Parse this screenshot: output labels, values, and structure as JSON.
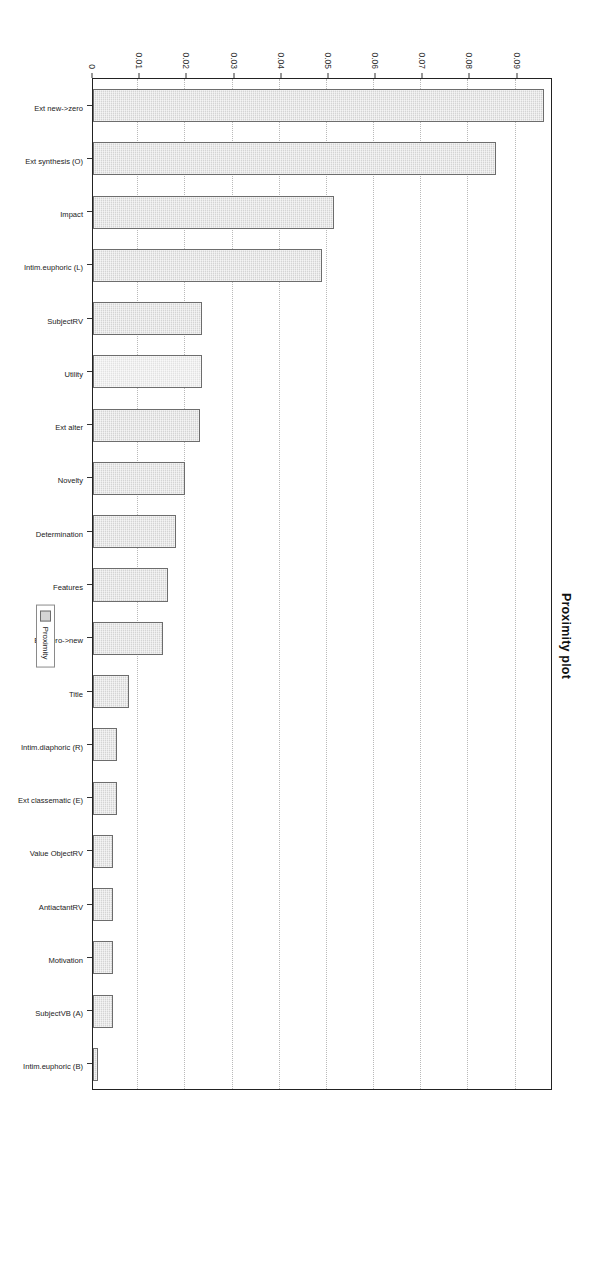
{
  "chart_data": {
    "type": "bar",
    "title": "Proximity plot",
    "xlabel": "",
    "ylabel": "",
    "orientation": "vertical-rotated-90",
    "grid": true,
    "legend_position": "bottom-center",
    "legend": [
      "Proximity"
    ],
    "ylim": [
      0,
      0.0975
    ],
    "yticks": [
      "0",
      "0.01",
      "0.02",
      "0.03",
      "0.04",
      "0.05",
      "0.06",
      "0.07",
      "0.08",
      "0.09"
    ],
    "ytick_values": [
      0,
      0.01,
      0.02,
      0.03,
      0.04,
      0.05,
      0.06,
      0.07,
      0.08,
      0.09
    ],
    "categories": [
      "Ext new->zero",
      "Ext synthesis (O)",
      "Impact",
      "Intim.euphoric (L)",
      "SubjectRV",
      "Utility",
      "Ext alter",
      "Novelty",
      "Determination",
      "Features",
      "Ext zero->new",
      "Title",
      "Intim.diaphoric (R)",
      "Ext classematic (E)",
      "Value ObjectRV",
      "AntiactantRV",
      "Motivation",
      "SubjectVB (A)",
      "Intim.euphoric (B)"
    ],
    "values": [
      0.0955,
      0.0855,
      0.051,
      0.0485,
      0.0232,
      0.0232,
      0.0227,
      0.0195,
      0.0175,
      0.0158,
      0.0148,
      0.0077,
      0.005,
      0.005,
      0.0043,
      0.0043,
      0.0043,
      0.0043,
      0.001
    ],
    "series": [
      {
        "name": "Proximity",
        "values": [
          0.0955,
          0.0855,
          0.051,
          0.0485,
          0.0232,
          0.0232,
          0.0227,
          0.0195,
          0.0175,
          0.0158,
          0.0148,
          0.0077,
          0.005,
          0.005,
          0.0043,
          0.0043,
          0.0043,
          0.0043,
          0.001
        ]
      }
    ],
    "highlight_index": 5,
    "colors": {
      "bar_fill": "#d4d4d4",
      "bar_fill_highlight": "#e2e2e2",
      "bar_stroke": "#6d6d6d",
      "grid": "#b9b9b9",
      "axis": "#222222",
      "text": "#222222",
      "background": "#ffffff"
    }
  }
}
